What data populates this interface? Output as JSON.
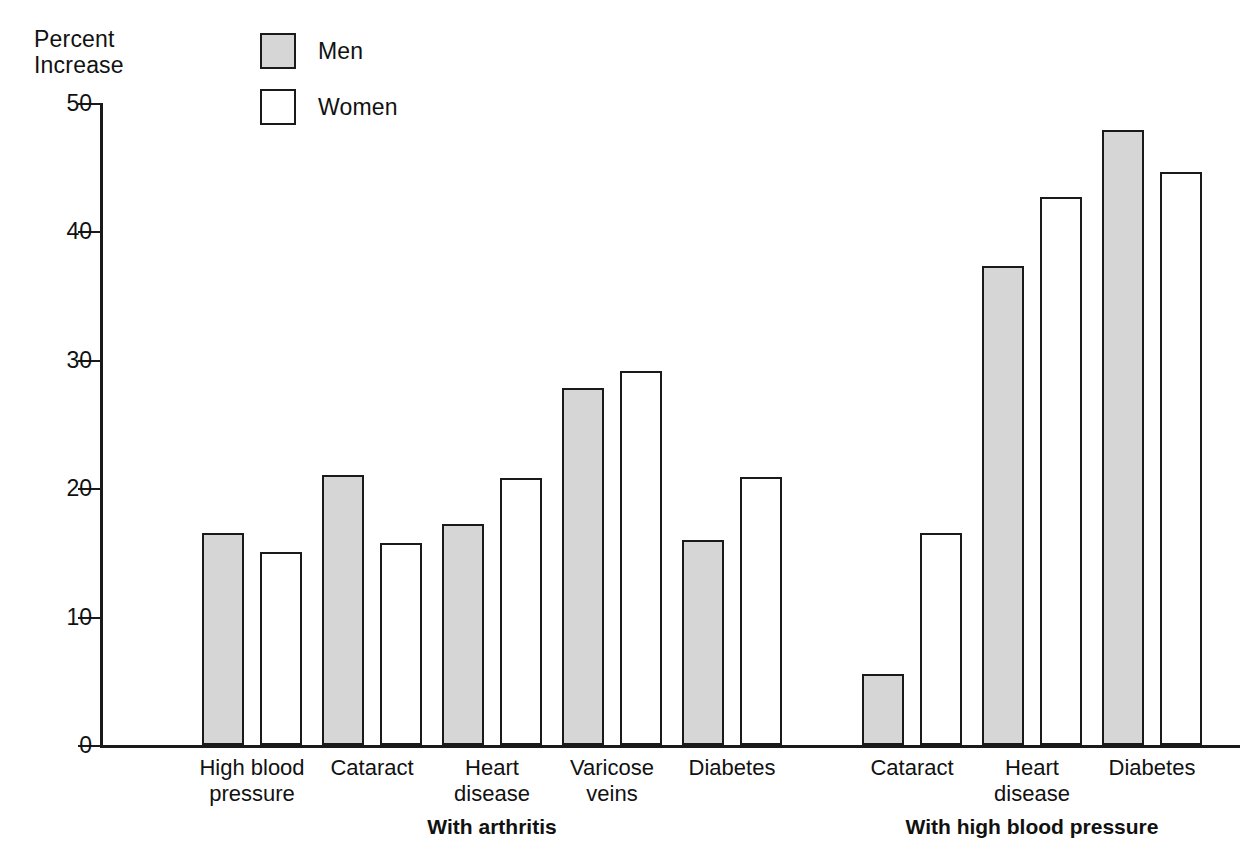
{
  "chart_data": {
    "type": "bar",
    "title": "",
    "subtitle": "",
    "ylabel": "Percent\nIncrease",
    "xlabel": "",
    "ylim": [
      0,
      50
    ],
    "yticks": [
      0,
      10,
      20,
      30,
      40,
      50
    ],
    "ytick_labels": [
      "0",
      "10",
      "20",
      "30",
      "40",
      "50"
    ],
    "grid": false,
    "legend_position": "top-center",
    "legend": [
      {
        "name": "Men",
        "color": "#d6d6d6"
      },
      {
        "name": "Women",
        "color": "#ffffff"
      }
    ],
    "series": [
      {
        "name": "Men",
        "values": [
          16.5,
          21.0,
          17.2,
          27.8,
          16.0,
          5.5,
          37.3,
          47.9
        ]
      },
      {
        "name": "Women",
        "values": [
          15.0,
          15.7,
          20.8,
          29.1,
          20.9,
          16.5,
          42.7,
          44.6
        ]
      }
    ],
    "categories": [
      "High blood\npressure",
      "Cataract",
      "Heart\ndisease",
      "Varicose\nveins",
      "Diabetes",
      "Cataract",
      "Heart\ndisease",
      "Diabetes"
    ],
    "groups": [
      {
        "label": "With arthritis",
        "category_indices": [
          0,
          1,
          2,
          3,
          4
        ]
      },
      {
        "label": "With high blood pressure",
        "category_indices": [
          5,
          6,
          7
        ]
      }
    ]
  },
  "colors": {
    "men_fill": "#d6d6d6",
    "women_fill": "#ffffff",
    "stroke": "#1a1a1a",
    "background": "#ffffff"
  }
}
